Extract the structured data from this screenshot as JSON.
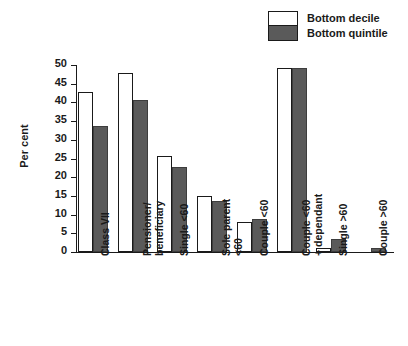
{
  "chart_data": {
    "type": "bar",
    "title": "",
    "subtitle": "",
    "xlabel": "",
    "ylabel": "Per cent",
    "ylim": [
      0,
      50
    ],
    "yticks": [
      0,
      5,
      10,
      15,
      20,
      25,
      30,
      35,
      40,
      45,
      50
    ],
    "ytick_labels": [
      "0",
      "5",
      "10",
      "15",
      "20",
      "25",
      "30",
      "35",
      "40",
      "45",
      "50"
    ],
    "grid": false,
    "legend_position": "top-right",
    "categories": [
      "Class VII",
      "Pensioner/\nbeneficiary",
      "Single <60",
      "Sole parent\n<60",
      "Couple <60",
      "Couple <60\n+ dependant",
      "Single >60",
      "Couple >60"
    ],
    "series": [
      {
        "name": "Bottom decile",
        "color": "#ffffff",
        "values": [
          42.8,
          47.8,
          25.8,
          14.9,
          8.0,
          49.2,
          1.2,
          0.0
        ]
      },
      {
        "name": "Bottom quintile",
        "color": "#5a5a5a",
        "values": [
          33.8,
          40.7,
          22.8,
          13.7,
          8.8,
          49.2,
          3.4,
          1.2
        ]
      }
    ]
  },
  "legend": {
    "items": [
      {
        "label": "Bottom decile",
        "swatch": "white"
      },
      {
        "label": "Bottom quintile",
        "swatch": "dark-gray"
      }
    ]
  },
  "colors": {
    "decile_fill": "#ffffff",
    "quintile_fill": "#5a5a5a",
    "axis": "#1a1a1a",
    "background": "#ffffff"
  }
}
